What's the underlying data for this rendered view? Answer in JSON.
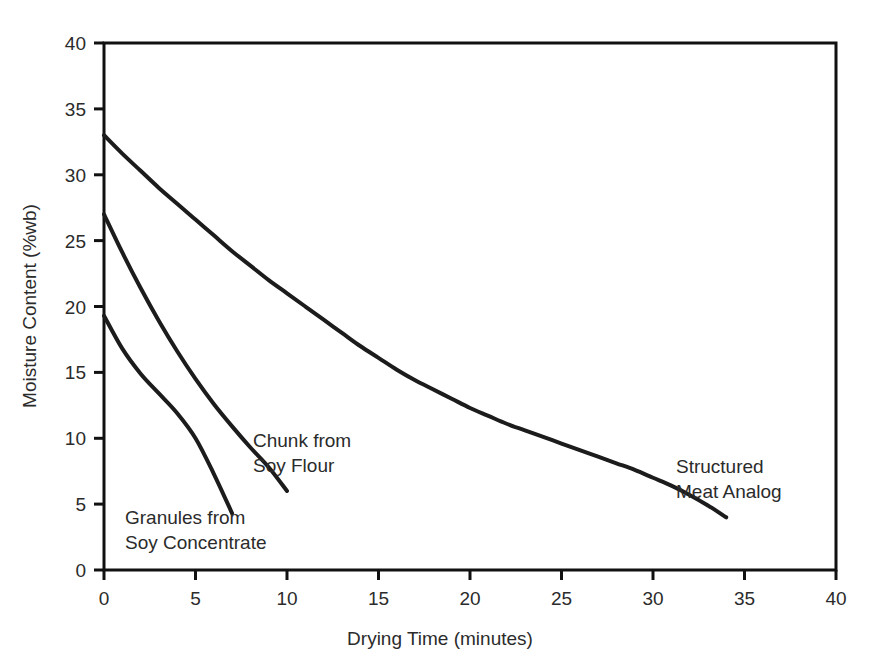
{
  "chart_data": {
    "type": "line",
    "title": "",
    "xlabel": "Drying Time (minutes)",
    "ylabel": "Moisture Content (%wb)",
    "xlim": [
      0,
      40
    ],
    "ylim": [
      0,
      40
    ],
    "xticks": [
      "0",
      "5",
      "10",
      "15",
      "20",
      "25",
      "30",
      "35",
      "40"
    ],
    "yticks": [
      "0",
      "5",
      "10",
      "15",
      "20",
      "25",
      "30",
      "35",
      "40"
    ],
    "grid": false,
    "legend_position": "inline-annotations",
    "line_color": "#1c1c1c",
    "series": [
      {
        "name": "Structured Meat Analog",
        "label_lines": [
          "Structured",
          "Meat Analog"
        ],
        "x": [
          0,
          1,
          2,
          3,
          4,
          5,
          6,
          7,
          8,
          9,
          10,
          11,
          12,
          13,
          14,
          15,
          16,
          17,
          18,
          19,
          20,
          21,
          22,
          23,
          24,
          25,
          26,
          27,
          28,
          29,
          30,
          31,
          32,
          33,
          34
        ],
        "values": [
          33.0,
          31.6,
          30.3,
          29.0,
          27.8,
          26.6,
          25.4,
          24.2,
          23.1,
          22.0,
          21.0,
          20.0,
          19.0,
          18.0,
          17.0,
          16.1,
          15.2,
          14.4,
          13.7,
          13.0,
          12.3,
          11.7,
          11.1,
          10.6,
          10.1,
          9.6,
          9.1,
          8.6,
          8.1,
          7.6,
          7.0,
          6.4,
          5.7,
          4.9,
          4.0
        ]
      },
      {
        "name": "Chunk from Soy Flour",
        "label_lines": [
          "Chunk from",
          "Soy Flour"
        ],
        "x": [
          0,
          1,
          2,
          3,
          4,
          5,
          6,
          7,
          8,
          9,
          10
        ],
        "values": [
          27.0,
          24.1,
          21.4,
          18.9,
          16.6,
          14.5,
          12.6,
          10.9,
          9.3,
          7.8,
          6.0
        ]
      },
      {
        "name": "Granules from Soy Concentrate",
        "label_lines": [
          "Granules from",
          "Soy Concentrate"
        ],
        "x": [
          0,
          1,
          2,
          3,
          4,
          5,
          6,
          7
        ],
        "values": [
          19.3,
          16.8,
          14.9,
          13.4,
          11.9,
          10.0,
          7.3,
          4.3
        ]
      }
    ]
  },
  "axes": {
    "x_title": "Drying Time (minutes)",
    "y_title": "Moisture Content (%wb)",
    "x_tick_labels": [
      "0",
      "5",
      "10",
      "15",
      "20",
      "25",
      "30",
      "35",
      "40"
    ],
    "y_tick_labels": [
      "0",
      "5",
      "10",
      "15",
      "20",
      "25",
      "30",
      "35",
      "40"
    ]
  },
  "annotations": {
    "chunk_line1": "Chunk from",
    "chunk_line2": "Soy Flour",
    "granules_line1": "Granules from",
    "granules_line2": "Soy Concentrate",
    "structured_line1": "Structured",
    "structured_line2": "Meat Analog"
  }
}
